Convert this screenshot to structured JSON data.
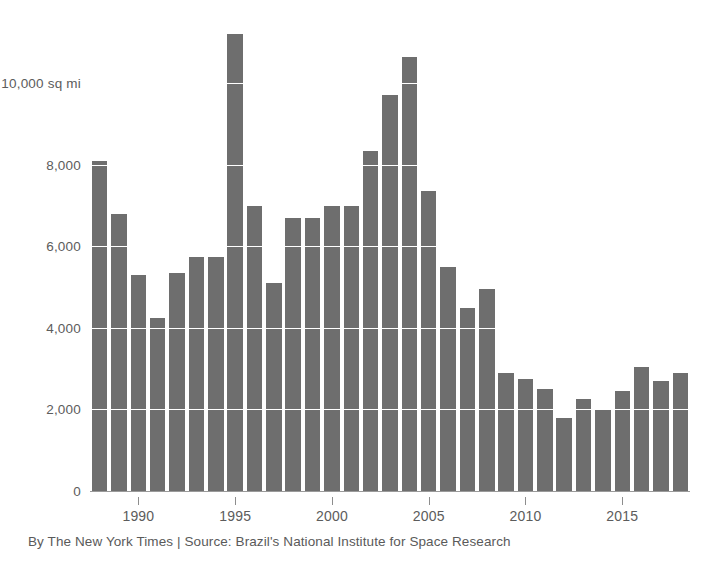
{
  "chart_data": {
    "type": "bar",
    "title": "",
    "subtitle": "",
    "xlabel": "",
    "ylabel": "10,000 sq mi",
    "unit_label": "10,000 sq mi",
    "categories": [
      1988,
      1989,
      1990,
      1991,
      1992,
      1993,
      1994,
      1995,
      1996,
      1997,
      1998,
      1999,
      2000,
      2001,
      2002,
      2003,
      2004,
      2005,
      2006,
      2007,
      2008,
      2009,
      2010,
      2011,
      2012,
      2013,
      2014,
      2015,
      2016,
      2017,
      2018
    ],
    "values": [
      8100,
      6800,
      5300,
      4250,
      5350,
      5750,
      5750,
      11200,
      7000,
      5100,
      6700,
      6700,
      7000,
      7000,
      8350,
      9700,
      10650,
      7350,
      5500,
      4500,
      4950,
      2900,
      2750,
      2500,
      1800,
      2250,
      2000,
      2450,
      3050,
      2700,
      2900
    ],
    "ylim": [
      0,
      11600
    ],
    "xlim": [
      1987.5,
      2018.5
    ],
    "yticks": [
      0,
      2000,
      4000,
      6000,
      8000,
      10000
    ],
    "ytick_labels": [
      "0",
      "2,000",
      "4,000",
      "6,000",
      "8,000",
      "10,000 sq mi"
    ],
    "xticks": [
      1990,
      1995,
      2000,
      2005,
      2010,
      2015
    ],
    "xtick_labels": [
      "1990",
      "1995",
      "2000",
      "2005",
      "2010",
      "2015"
    ],
    "grid": true,
    "grid_axis": "y",
    "grid_color": "#ffffff",
    "bar_color": "#6e6e6e",
    "legend": null,
    "legend_position": "none",
    "annotations": []
  },
  "caption": {
    "credit": "By The New York Times | Source: Brazil's National Institute for Space Research"
  },
  "axis": {
    "y_unit_label": "10,000 sq mi"
  }
}
